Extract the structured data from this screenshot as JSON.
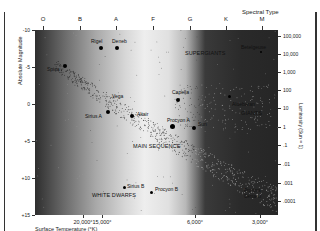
{
  "chart_data": {
    "type": "scatter",
    "top_axis": {
      "label": "Spectral Type",
      "ticks": [
        "O",
        "B",
        "A",
        "F",
        "G",
        "K",
        "M"
      ]
    },
    "xlabel": "Surface Temperature (°K)",
    "x_ticks": [
      "20,000°",
      "15,000°",
      "6,000°",
      "3,000°"
    ],
    "ylabel": "Absolute Magnitude",
    "y_ticks": [
      "-10",
      "-5",
      "0",
      "+5",
      "+10",
      "+15"
    ],
    "ylim": [
      -10,
      15
    ],
    "ylabel_right": "Luminosity (Sun = 1)",
    "y_right_ticks": [
      "100,000",
      "10,000",
      "1,000",
      "100",
      "10",
      "1",
      ".1",
      ".01",
      ".001",
      ".0001"
    ],
    "regions": [
      "SUPERGIANTS",
      "GIANTS",
      "MAIN SEQUENCE",
      "WHITE DWARFS"
    ],
    "labeled_stars": [
      {
        "name": "Rigel",
        "spectral": "B",
        "magnitude": -7
      },
      {
        "name": "Deneb",
        "spectral": "A",
        "magnitude": -7
      },
      {
        "name": "Spica",
        "spectral": "B",
        "magnitude": -4.5
      },
      {
        "name": "Betelgeuse",
        "spectral": "M",
        "magnitude": -6
      },
      {
        "name": "Vega",
        "spectral": "A",
        "magnitude": 0.5
      },
      {
        "name": "Capella",
        "spectral": "G",
        "magnitude": -0.5
      },
      {
        "name": "Aldebaran",
        "spectral": "K",
        "magnitude": -0.5
      },
      {
        "name": "Sirius A",
        "spectral": "A",
        "magnitude": 1.5
      },
      {
        "name": "Altair",
        "spectral": "A",
        "magnitude": 2
      },
      {
        "name": "Procyon A",
        "spectral": "F",
        "magnitude": 3
      },
      {
        "name": "Sun",
        "spectral": "G",
        "magnitude": 4.8
      },
      {
        "name": "Sirius B",
        "spectral": "A",
        "magnitude": 11.5
      },
      {
        "name": "Procyon B",
        "spectral": "F",
        "magnitude": 13
      },
      {
        "name": "Proxima Centauri",
        "spectral": "M",
        "magnitude": 15
      }
    ],
    "grid": false,
    "legend": "none"
  },
  "axis": {
    "spectral_title": "Spectral Type",
    "spectral": [
      {
        "label": "O",
        "x": 43
      },
      {
        "label": "B",
        "x": 80
      },
      {
        "label": "A",
        "x": 116
      },
      {
        "label": "F",
        "x": 153
      },
      {
        "label": "G",
        "x": 190
      },
      {
        "label": "K",
        "x": 226
      },
      {
        "label": "M",
        "x": 262
      }
    ],
    "left_ticks": [
      {
        "label": "-10",
        "y": 30
      },
      {
        "label": "-5",
        "y": 67
      },
      {
        "label": "0",
        "y": 104
      },
      {
        "label": "+5",
        "y": 141
      },
      {
        "label": "+10",
        "y": 178
      },
      {
        "label": "+15",
        "y": 215
      }
    ],
    "left_title": "Absolute Magnitude",
    "right_ticks": [
      {
        "label": "100,000",
        "y": 36
      },
      {
        "label": "10,000",
        "y": 54
      },
      {
        "label": "1,000",
        "y": 72
      },
      {
        "label": "100",
        "y": 90
      },
      {
        "label": "10",
        "y": 108
      },
      {
        "label": "1",
        "y": 127
      },
      {
        "label": ".1",
        "y": 145
      },
      {
        "label": ".01",
        "y": 164
      },
      {
        "label": ".001",
        "y": 183
      },
      {
        "label": ".0001",
        "y": 201
      }
    ],
    "right_title": "Luminosity (Sun = 1)",
    "bottom_ticks": [
      {
        "label": "20,000°",
        "x": 83
      },
      {
        "label": "15,000°",
        "x": 102
      },
      {
        "label": "6,000°",
        "x": 195
      },
      {
        "label": "3,000°",
        "x": 260
      }
    ],
    "bottom_title": "Surface Temperature (°K)"
  },
  "labels": {
    "supergiants": "SUPERGIANTS",
    "giants": "GIANTS",
    "main_sequence": "MAIN SEQUENCE",
    "white_dwarfs": "WHITE DWARFS",
    "rigel": "Rigel",
    "deneb": "Deneb",
    "spica": "Spica",
    "betelgeuse": "Betelgeuse",
    "vega": "Vega",
    "capella": "Capella",
    "aldebaran": "Aldebaran",
    "sirius_a": "Sirius A",
    "altair": "Altair",
    "procyon_a": "Procyon A",
    "sun": "Sun",
    "sirius_b": "Sirius B",
    "procyon_b": "Procyon B",
    "proxima": "Proxima Centauri"
  }
}
